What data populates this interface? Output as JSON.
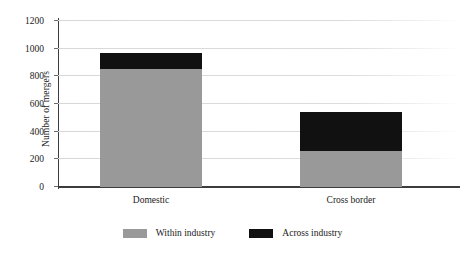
{
  "chart_data": {
    "type": "bar",
    "subtype": "stacked-bar",
    "title": "",
    "xlabel": "",
    "ylabel": "Number of mergers",
    "categories": [
      "Domestic",
      "Cross border"
    ],
    "series": [
      {
        "name": "Within industry",
        "color": "#999999",
        "values": [
          855,
          260
        ]
      },
      {
        "name": "Across industry",
        "color": "#111111",
        "values": [
          115,
          280
        ]
      }
    ],
    "totals": [
      970,
      540
    ],
    "ylim": [
      0,
      1200
    ],
    "ytick_step": 200,
    "yticks": [
      0,
      200,
      400,
      600,
      800,
      1000,
      1200
    ],
    "ytick_labels": [
      "0",
      "200",
      "400",
      "600",
      "800",
      "1000",
      "1200"
    ],
    "grid": "horizontal",
    "legend_position": "bottom-center"
  },
  "legend": {
    "items": [
      {
        "label": "Within industry",
        "swatch": "within"
      },
      {
        "label": "Across industry",
        "swatch": "across"
      }
    ]
  }
}
